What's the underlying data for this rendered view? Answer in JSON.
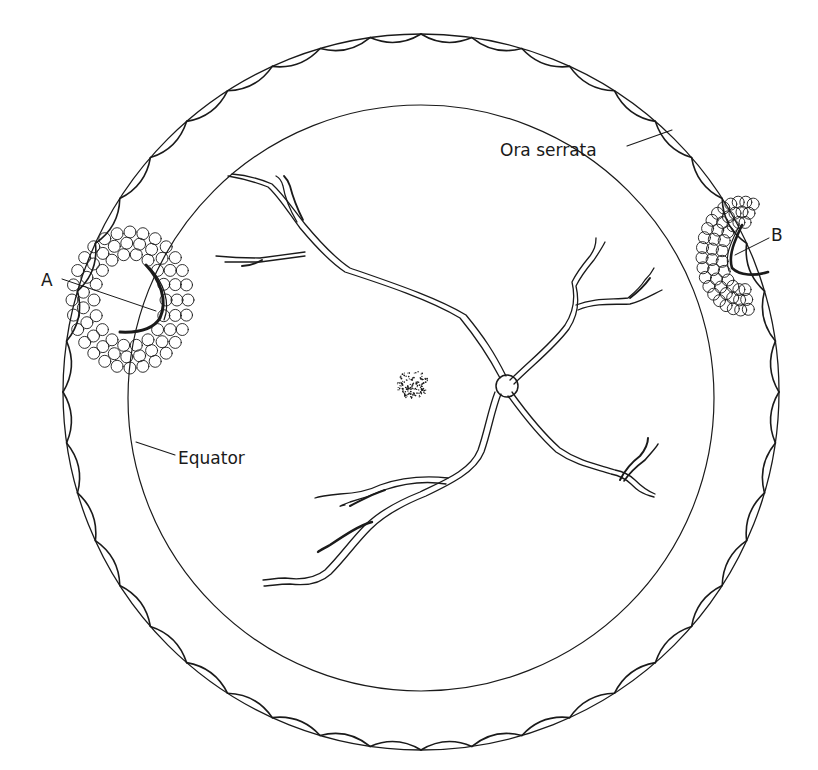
{
  "figure": {
    "type": "fundus-diagram",
    "labels": {
      "ora_serrata": "Ora serrata",
      "equator": "Equator",
      "a": "A",
      "b": "B"
    },
    "structures": {
      "outer_ring": "ora-serrata",
      "inner_ring": "equator",
      "optic_disc": "optic-disc",
      "macula": "macula",
      "lesion_a": "lesion-a-with-surrounding-laser-spots",
      "lesion_b": "lesion-b-with-surrounding-laser-spots"
    },
    "colors": {
      "line": "#1a1a1a",
      "background": "#ffffff"
    }
  }
}
